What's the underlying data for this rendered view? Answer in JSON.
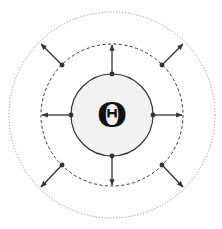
{
  "diagram": {
    "center_symbol": "Θ",
    "center": {
      "x": 112,
      "y": 115
    },
    "circles": [
      {
        "name": "outer-dotted-circle",
        "radius": 103,
        "style": "dotted",
        "color": "#9a9a9a"
      },
      {
        "name": "middle-dashed-circle",
        "radius": 71,
        "style": "dashed",
        "color": "#333333"
      },
      {
        "name": "inner-solid-circle",
        "radius": 41,
        "style": "solid",
        "color": "#333333",
        "fill": "#f2f2f2"
      }
    ],
    "arrows": {
      "cardinal": {
        "from_radius": 41,
        "to_radius": 71,
        "angles_deg": [
          270,
          0,
          90,
          180
        ]
      },
      "diagonal": {
        "from_radius": 71,
        "to_radius": 103,
        "angles_deg": [
          225,
          315,
          45,
          135
        ]
      }
    },
    "colors": {
      "stroke": "#333333",
      "inner_fill": "#f2f2f2",
      "outer_dots": "#9a9a9a",
      "background": "#ffffff"
    }
  }
}
